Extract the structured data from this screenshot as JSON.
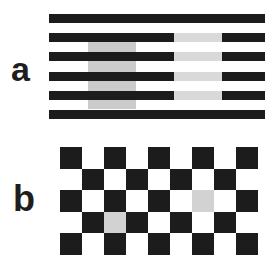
{
  "figure": {
    "colors": {
      "background": "#ffffff",
      "dark": "#1c1c1c",
      "gray_left": "#cbcbcb",
      "gray_right": "#d9d9d9",
      "gray_cell": "#d2d2d2"
    },
    "panel_a": {
      "label": "a",
      "description": "Horizontal black bars with two gray rectangles: left gray lies on black bars, right gray lies in gaps between bars",
      "bar_count": 6,
      "bars": [
        {
          "y": 14,
          "h": 9,
          "x": 49,
          "w": 216
        },
        {
          "y": 33,
          "h": 9,
          "x": 49,
          "w": 216
        },
        {
          "y": 52,
          "h": 9,
          "x": 49,
          "w": 216
        },
        {
          "y": 72,
          "h": 9,
          "x": 49,
          "w": 216
        },
        {
          "y": 91,
          "h": 9,
          "x": 49,
          "w": 216
        },
        {
          "y": 110,
          "h": 9,
          "x": 49,
          "w": 216
        }
      ],
      "left_patch": {
        "x": 88,
        "y": 42,
        "w": 48,
        "h": 67,
        "placement": "behind bars (on white gaps)"
      },
      "right_patch": {
        "x": 174,
        "w": 48,
        "rows": [
          2,
          3,
          4,
          5
        ],
        "placement": "replacing bar segments"
      }
    },
    "panel_b": {
      "label": "b",
      "description": "Checkerboard 9 columns x 5 rows with two gray squares",
      "cols": 9,
      "rows": 5,
      "origin": {
        "x": 60,
        "y": 147
      },
      "cell_w": 22,
      "cell_h": 21.5,
      "gray_cells": [
        {
          "row": 3,
          "col": 2,
          "note": "surrounded by black"
        },
        {
          "row": 2,
          "col": 6,
          "note": "surrounded by white"
        }
      ]
    }
  }
}
